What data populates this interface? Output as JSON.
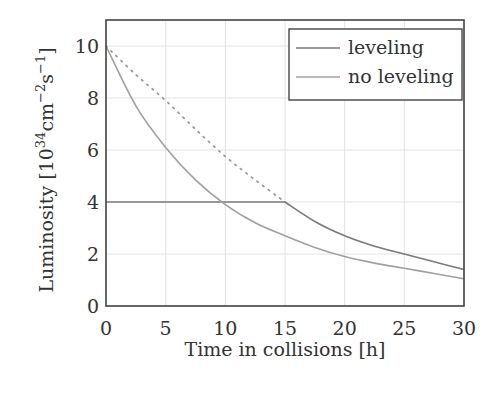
{
  "chart_data": {
    "type": "line",
    "title": "",
    "xlabel": "Time in collisions [h]",
    "ylabel": "Luminosity [10^34 cm^-2 s^-1]",
    "ylabel_parts": {
      "main": "Luminosity [10",
      "exp1": "34",
      "mid": "cm",
      "exp2": "−2",
      "s": "s",
      "exp3": "−1",
      "close": "]"
    },
    "xlim": [
      0,
      30
    ],
    "ylim": [
      0,
      11
    ],
    "xticks": [
      0,
      5,
      10,
      15,
      20,
      25,
      30
    ],
    "yticks": [
      0,
      2,
      4,
      6,
      8,
      10
    ],
    "grid": true,
    "legend_position": "upper right",
    "x": [
      0,
      2.5,
      5,
      7.5,
      10,
      12.5,
      15,
      17.5,
      20,
      22.5,
      25,
      27.5,
      30
    ],
    "series": [
      {
        "name": "leveling",
        "color": "#7a7a7a",
        "style": "solid",
        "values": [
          4.0,
          4.0,
          4.0,
          4.0,
          4.0,
          4.0,
          4.0,
          3.25,
          2.7,
          2.3,
          2.0,
          1.7,
          1.4
        ]
      },
      {
        "name": "no leveling",
        "color": "#a0a0a0",
        "style": "solid",
        "values": [
          10.0,
          7.7,
          6.1,
          4.85,
          3.9,
          3.2,
          2.7,
          2.25,
          1.9,
          1.65,
          1.45,
          1.25,
          1.05
        ]
      },
      {
        "name": "leveling (extrapolated, unlabeled)",
        "color": "#9a9a9a",
        "style": "dotted",
        "x": [
          0,
          2.5,
          5,
          7.5,
          10,
          12.5,
          15
        ],
        "values": [
          10.0,
          8.9,
          7.9,
          6.8,
          5.75,
          4.85,
          4.0
        ]
      }
    ]
  },
  "legend": {
    "items": [
      {
        "label": "leveling",
        "color": "#7a7a7a"
      },
      {
        "label": "no leveling",
        "color": "#a0a0a0"
      }
    ]
  }
}
